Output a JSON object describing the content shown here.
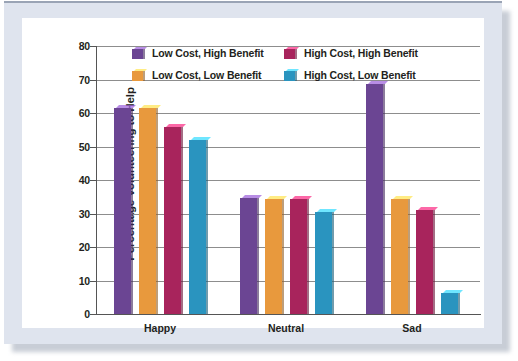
{
  "chart_data": {
    "type": "bar",
    "title": "",
    "xlabel": "",
    "ylabel": "Percentage Volunteering to Help",
    "categories": [
      "Happy",
      "Neutral",
      "Sad"
    ],
    "ylim": [
      0,
      80
    ],
    "yticks": [
      0,
      10,
      20,
      30,
      40,
      50,
      60,
      70,
      80
    ],
    "ytick_labels": [
      "0",
      "10",
      "20",
      "30",
      "40",
      "50",
      "60",
      "70",
      "80"
    ],
    "grid": true,
    "legend_position": "top-center",
    "series": [
      {
        "name": "Low Cost, High Benefit",
        "color": "#6B4593",
        "values": [
          61.5,
          34.5,
          68.8
        ]
      },
      {
        "name": "Low Cost, Low Benefit",
        "color": "#E8993D",
        "values": [
          61.5,
          34.3,
          34.2
        ]
      },
      {
        "name": "High Cost, High Benefit",
        "color": "#A8245C",
        "values": [
          55.8,
          34.4,
          31.0
        ]
      },
      {
        "name": "High Cost, Low Benefit",
        "color": "#2A94BF",
        "values": [
          52.0,
          30.4,
          6.4
        ]
      }
    ]
  },
  "legend": {
    "rows": [
      [
        {
          "label": "Low Cost, High Benefit",
          "color": "#6B4593"
        },
        {
          "label": "High Cost, High Benefit",
          "color": "#A8245C"
        }
      ],
      [
        {
          "label": "Low Cost, Low Benefit",
          "color": "#E8993D"
        },
        {
          "label": "High Cost, Low Benefit",
          "color": "#2A94BF"
        }
      ]
    ]
  }
}
